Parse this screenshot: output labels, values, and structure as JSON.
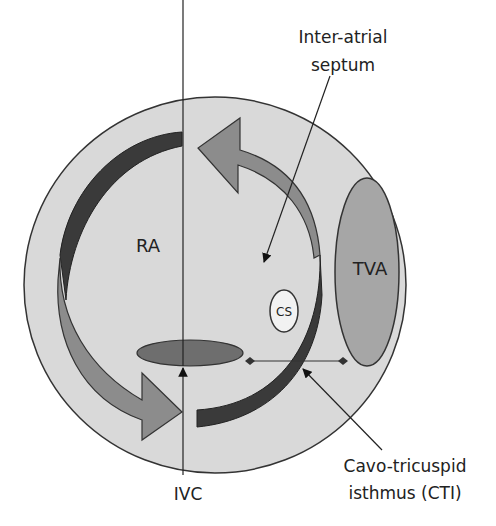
{
  "diagram": {
    "labels": {
      "septum_line1": "Inter-atrial",
      "septum_line2": "septum",
      "ra": "RA",
      "tva": "TVA",
      "cs": "CS",
      "ivc": "IVC",
      "cti_line1": "Cavo-tricuspid",
      "cti_line2": "isthmus (CTI)"
    },
    "colors": {
      "background": "#ffffff",
      "atrium_fill": "#d9d9d9",
      "outline": "#333333",
      "tva_fill": "#a6a6a6",
      "ivc_fill": "#6e6e6e",
      "dark_arc": "#3a3a3a",
      "light_arrow": "#8c8c8c",
      "cs_fill": "#f2f2f2",
      "text": "#222222"
    }
  }
}
